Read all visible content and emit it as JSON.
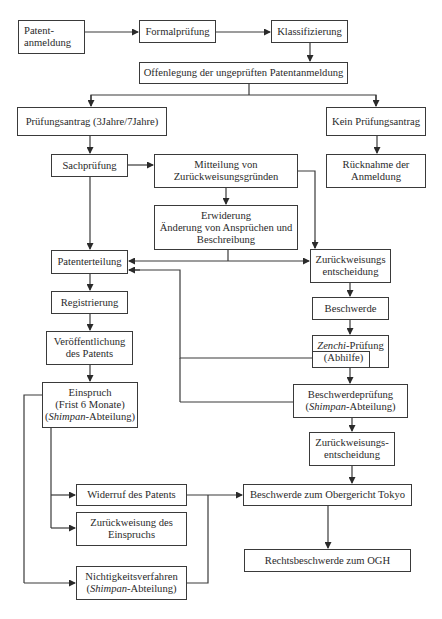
{
  "diagram": {
    "type": "flowchart",
    "nodes": {
      "anmeldung": {
        "line1": "Patent-",
        "line2": "anmeldung"
      },
      "formal": {
        "line1": "Formalprüfung"
      },
      "klass": {
        "line1": "Klassifizierung"
      },
      "offen": {
        "line1": "Offenlegung der ungeprüften Patentanmeldung"
      },
      "antrag": {
        "line1": "Prüfungsantrag (3Jahre/7Jahre)"
      },
      "kein": {
        "line1": "Kein Prüfungsantrag"
      },
      "sach": {
        "line1": "Sachprüfung"
      },
      "mitteilung": {
        "line1": "Mitteilung von",
        "line2": "Zurückweisungsgründen"
      },
      "ruecknahme": {
        "line1": "Rücknahme der",
        "line2": "Anmeldung"
      },
      "erwiderung": {
        "line1": "Erwiderung",
        "line2": "Änderung von Ansprüchen und",
        "line3": "Beschreibung"
      },
      "erteilung": {
        "line1": "Patenterteilung"
      },
      "zurueck1": {
        "line1": "Zurückweisungs",
        "line2": "entscheidung"
      },
      "registrierung": {
        "line1": "Registrierung"
      },
      "beschwerde": {
        "line1": "Beschwerde"
      },
      "veroeff": {
        "line1": "Veröffentlichung",
        "line2": "des Patents"
      },
      "zenchi": {
        "italic": "Zenchi",
        "rest": "-Prüfung",
        "line2": "(Abhilfe)"
      },
      "einspruch": {
        "line1": "Einspruch",
        "line2": "(Frist 6 Monate)",
        "italic": "Shimpan",
        "rest": "-Abteilung)",
        "open": "("
      },
      "bpruefung": {
        "line1": "Beschwerdeprüfung",
        "open": "(",
        "italic": "Shimpan",
        "rest": "-Abteilung)"
      },
      "zurueck2": {
        "line1": "Zurückweisungs-",
        "line2": "entscheidung"
      },
      "widerruf": {
        "line1": "Widerruf des Patents"
      },
      "obergericht": {
        "line1": "Beschwerde zum Obergericht Tokyo"
      },
      "zeinspruch": {
        "line1": "Zurückweisung des",
        "line2": "Einspruchs"
      },
      "ogh": {
        "line1": "Rechtsbeschwerde zum OGH"
      },
      "nichtig": {
        "line1": "Nichtigkeitsverfahren",
        "open": "(",
        "italic": "Shimpan",
        "rest": "-Abteilung)"
      }
    },
    "edges": [
      [
        "Patentanmeldung",
        "Formalprüfung"
      ],
      [
        "Formalprüfung",
        "Klassifizierung"
      ],
      [
        "Klassifizierung",
        "Offenlegung der ungeprüften Patentanmeldung"
      ],
      [
        "Offenlegung der ungeprüften Patentanmeldung",
        "Prüfungsantrag (3Jahre/7Jahre)"
      ],
      [
        "Offenlegung der ungeprüften Patentanmeldung",
        "Kein Prüfungsantrag"
      ],
      [
        "Kein Prüfungsantrag",
        "Rücknahme der Anmeldung"
      ],
      [
        "Prüfungsantrag (3Jahre/7Jahre)",
        "Sachprüfung"
      ],
      [
        "Sachprüfung",
        "Mitteilung von Zurückweisungsgründen"
      ],
      [
        "Sachprüfung",
        "Patenterteilung"
      ],
      [
        "Mitteilung von Zurückweisungsgründen",
        "Erwiderung"
      ],
      [
        "Mitteilung von Zurückweisungsgründen",
        "Zurückweisungsentscheidung"
      ],
      [
        "Erwiderung",
        "Patenterteilung"
      ],
      [
        "Erwiderung",
        "Zurückweisungsentscheidung"
      ],
      [
        "Zurückweisungsentscheidung",
        "Beschwerde"
      ],
      [
        "Beschwerde",
        "Zenchi-Prüfung (Abhilfe)"
      ],
      [
        "Zenchi-Prüfung (Abhilfe)",
        "Patenterteilung"
      ],
      [
        "Zenchi-Prüfung (Abhilfe)",
        "Beschwerdeprüfung"
      ],
      [
        "Beschwerdeprüfung",
        "Patenterteilung"
      ],
      [
        "Beschwerdeprüfung",
        "Zurückweisungs-entscheidung"
      ],
      [
        "Zurückweisungs-entscheidung",
        "Beschwerde zum Obergericht Tokyo"
      ],
      [
        "Patenterteilung",
        "Registrierung"
      ],
      [
        "Registrierung",
        "Veröffentlichung des Patents"
      ],
      [
        "Veröffentlichung des Patents",
        "Einspruch"
      ],
      [
        "Einspruch",
        "Widerruf des Patents"
      ],
      [
        "Einspruch",
        "Zurückweisung des Einspruchs"
      ],
      [
        "Einspruch",
        "Nichtigkeitsverfahren"
      ],
      [
        "Widerruf des Patents",
        "Beschwerde zum Obergericht Tokyo"
      ],
      [
        "Nichtigkeitsverfahren",
        "Beschwerde zum Obergericht Tokyo"
      ],
      [
        "Beschwerde zum Obergericht Tokyo",
        "Rechtsbeschwerde zum OGH"
      ]
    ],
    "colors": {
      "line": "#3a3a3a",
      "text": "#2a2a2a",
      "background": "#ffffff"
    }
  }
}
